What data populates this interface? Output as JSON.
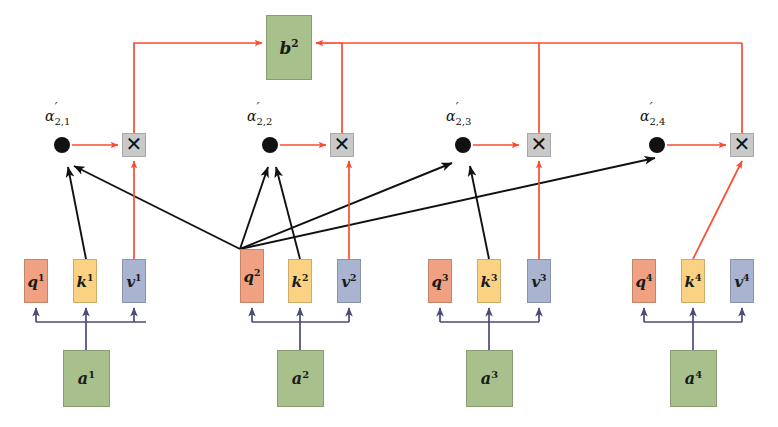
{
  "diagram": {
    "colors": {
      "query": "#f0a182",
      "key": "#fbd182",
      "value": "#a8b4d0",
      "input": "#a8c08c",
      "output": "#a8c08c",
      "multiplier_box": "#c9c9c9",
      "attention_arrow": "#fa4b32",
      "score_arrow": "#111111",
      "projection_arrow": "#4a4a7a"
    },
    "output": {
      "name": "output-vector",
      "label": "b",
      "superscript": "2"
    },
    "multipliers": [
      {
        "name": "multiply-1",
        "glyph": "✕"
      },
      {
        "name": "multiply-2",
        "glyph": "✕"
      },
      {
        "name": "multiply-3",
        "glyph": "✕"
      },
      {
        "name": "multiply-4",
        "glyph": "✕"
      }
    ],
    "attention_weights": [
      {
        "name": "alpha-2-1",
        "symbol": "α",
        "prime": "′",
        "subscript": "2,1"
      },
      {
        "name": "alpha-2-2",
        "symbol": "α",
        "prime": "′",
        "subscript": "2,2"
      },
      {
        "name": "alpha-2-3",
        "symbol": "α",
        "prime": "′",
        "subscript": "2,3"
      },
      {
        "name": "alpha-2-4",
        "symbol": "α",
        "prime": "′",
        "subscript": "2,4"
      }
    ],
    "groups": [
      {
        "index": "1",
        "input": {
          "label": "a",
          "superscript": "1"
        },
        "query": {
          "label": "q",
          "superscript": "1"
        },
        "key": {
          "label": "k",
          "superscript": "1"
        },
        "value": {
          "label": "v",
          "superscript": "1"
        }
      },
      {
        "index": "2",
        "input": {
          "label": "a",
          "superscript": "2"
        },
        "query": {
          "label": "q",
          "superscript": "2"
        },
        "key": {
          "label": "k",
          "superscript": "2"
        },
        "value": {
          "label": "v",
          "superscript": "2"
        }
      },
      {
        "index": "3",
        "input": {
          "label": "a",
          "superscript": "3"
        },
        "query": {
          "label": "q",
          "superscript": "3"
        },
        "key": {
          "label": "k",
          "superscript": "3"
        },
        "value": {
          "label": "v",
          "superscript": "3"
        }
      },
      {
        "index": "4",
        "input": {
          "label": "a",
          "superscript": "4"
        },
        "query": {
          "label": "q",
          "superscript": "4"
        },
        "key": {
          "label": "k",
          "superscript": "4"
        },
        "value": {
          "label": "v",
          "superscript": "4"
        }
      }
    ]
  }
}
